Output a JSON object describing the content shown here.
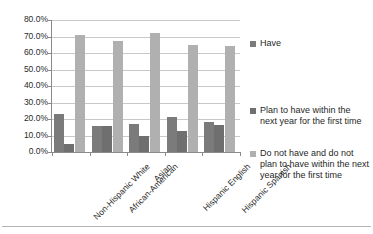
{
  "chart_data": {
    "type": "bar",
    "title": "",
    "xlabel": "",
    "ylabel": "",
    "ylim": [
      0,
      80
    ],
    "ytick_labels": [
      "80.0%",
      "70.0%",
      "60.0%",
      "50.0%",
      "40.0%",
      "30.0%",
      "20.0%",
      "10.0%",
      "0.0%"
    ],
    "ytick_values": [
      80,
      70,
      60,
      50,
      40,
      30,
      20,
      10,
      0
    ],
    "grid": true,
    "legend_position": "right",
    "categories": [
      "Non-Hispanic White",
      "African-American",
      "Asian",
      "Hispanic English",
      "Hispanic Spanish"
    ],
    "series": [
      {
        "name": "Have",
        "color": "#7b7b7b",
        "values": [
          23.0,
          15.5,
          17.0,
          21.0,
          18.0
        ]
      },
      {
        "name": "Plan to have within the next year for the first time",
        "color": "#6f6f6f",
        "values": [
          5.0,
          15.5,
          10.0,
          13.0,
          16.5
        ]
      },
      {
        "name": "Do not have and do not plan to have within the next year for the first time",
        "color": "#b0b0b0",
        "values": [
          71.0,
          67.0,
          72.0,
          65.0,
          64.0
        ]
      }
    ]
  },
  "colors": {
    "series_1": "#7b7b7b",
    "series_2": "#6f6f6f",
    "series_3": "#b0b0b0",
    "gridline": "#c9c9c9",
    "axis": "#8a8a8a",
    "text": "#1f1f1f",
    "background": "#ffffff"
  }
}
